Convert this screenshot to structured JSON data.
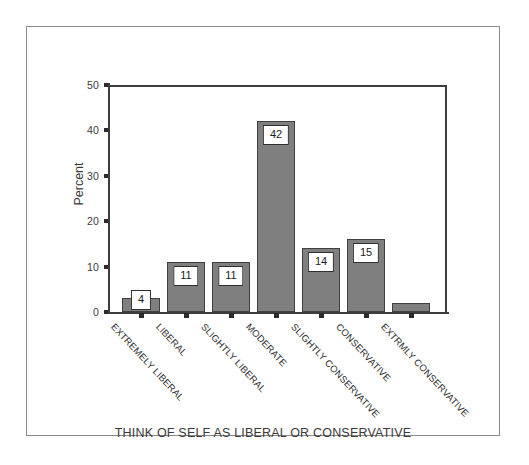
{
  "chart_data": {
    "type": "bar",
    "title": "",
    "xlabel": "THINK OF SELF AS LIBERAL OR CONSERVATIVE",
    "ylabel": "Percent",
    "ylim": [
      0,
      50
    ],
    "yticks": [
      0,
      10,
      20,
      30,
      40,
      50
    ],
    "grid": false,
    "legend": "none",
    "categories": [
      "EXTREMELY LIBERAL",
      "LIBERAL",
      "SLIGHTLY LIBERAL",
      "MODERATE",
      "SLIGHTLY CONSERVATIVE",
      "CONSERVATIVE",
      "EXTRMLY CONSERVATIVE"
    ],
    "values": [
      3,
      11,
      11,
      42,
      14,
      16,
      2
    ],
    "data_labels": [
      "4",
      "11",
      "11",
      "42",
      "14",
      "15",
      ""
    ],
    "bar_color": "#7f7f7f",
    "bar_edge_color": "#404040",
    "axis_color": "#3d3d3d",
    "label_box_background": "#ffffff",
    "label_box_border": "#2f2f2f"
  }
}
